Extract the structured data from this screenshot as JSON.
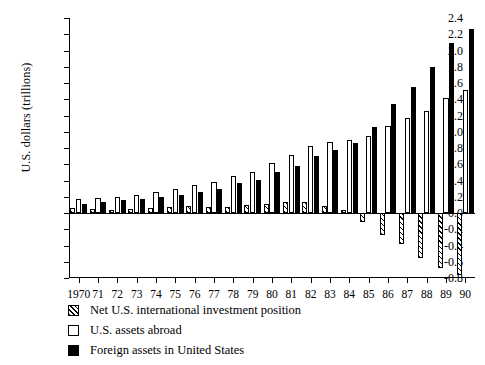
{
  "chart_data": {
    "type": "bar",
    "title": "",
    "xlabel": "",
    "ylabel": "U.S. dollars (trillions)",
    "ylim": [
      -0.8,
      2.4
    ],
    "ytick_step": 0.2,
    "grid": false,
    "legend_position": "below-plot-left",
    "categories": [
      "1970",
      "71",
      "72",
      "73",
      "74",
      "75",
      "76",
      "77",
      "78",
      "79",
      "80",
      "81",
      "82",
      "83",
      "84",
      "85",
      "86",
      "87",
      "88",
      "89",
      "90"
    ],
    "ytick_labels": [
      "2.4",
      "2.2",
      "2.0",
      "1.8",
      "1.6",
      "1.4",
      "1.2",
      "1.0",
      "0.8",
      "0.6",
      "0.4",
      "0.2",
      "0.0",
      "-0.2",
      "-0.4",
      "-0.6",
      "-0.8"
    ],
    "series": [
      {
        "name": "Net U.S. international investment position",
        "style": "hatched",
        "color": "#000000",
        "fill": "#ffffff",
        "values": [
          0.06,
          0.05,
          0.04,
          0.05,
          0.06,
          0.08,
          0.09,
          0.08,
          0.08,
          0.1,
          0.11,
          0.14,
          0.13,
          0.09,
          0.04,
          -0.11,
          -0.27,
          -0.38,
          -0.55,
          -0.68,
          -0.76
        ]
      },
      {
        "name": "U.S. assets abroad",
        "style": "open",
        "color": "#000000",
        "fill": "#ffffff",
        "values": [
          0.17,
          0.18,
          0.2,
          0.22,
          0.26,
          0.3,
          0.35,
          0.38,
          0.45,
          0.51,
          0.61,
          0.72,
          0.83,
          0.87,
          0.9,
          0.95,
          1.07,
          1.17,
          1.25,
          1.41,
          1.51
        ]
      },
      {
        "name": "Foreign assets in United States",
        "style": "solid",
        "color": "#000000",
        "fill": "#000000",
        "values": [
          0.11,
          0.13,
          0.16,
          0.17,
          0.2,
          0.22,
          0.26,
          0.3,
          0.37,
          0.41,
          0.5,
          0.58,
          0.7,
          0.78,
          0.86,
          1.06,
          1.34,
          1.55,
          1.8,
          2.09,
          2.27
        ]
      }
    ]
  },
  "axis": {
    "y_title": "U.S. dollars (trillions)"
  },
  "legend": {
    "items": [
      {
        "label": "Net U.S. international investment position",
        "swatch": "hatched-swatch"
      },
      {
        "label": "U.S. assets abroad",
        "swatch": "open-swatch"
      },
      {
        "label": "Foreign assets in United States",
        "swatch": "solid-swatch"
      }
    ]
  }
}
